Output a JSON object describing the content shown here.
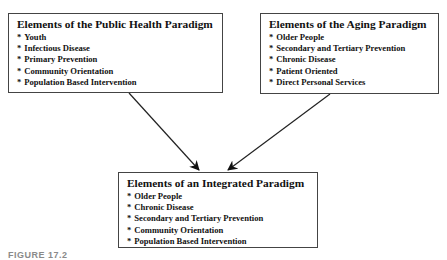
{
  "diagram": {
    "public_health": {
      "title": "Elements of the Public Health Paradigm",
      "items": [
        "Youth",
        "Infectious Disease",
        "Primary Prevention",
        "Community Orientation",
        "Population Based Intervention"
      ]
    },
    "aging": {
      "title": "Elements of the Aging Paradigm",
      "items": [
        "Older People",
        "Secondary and Tertiary Prevention",
        "Chronic Disease",
        "Patient Oriented",
        "Direct Personal Services"
      ]
    },
    "integrated": {
      "title": "Elements of an Integrated Paradigm",
      "items": [
        "Older People",
        "Chronic Disease",
        "Secondary and Tertiary Prevention",
        "Community Orientation",
        "Population Based Intervention"
      ]
    },
    "bullet": "*",
    "edges": [
      {
        "from": "public_health",
        "to": "integrated"
      },
      {
        "from": "aging",
        "to": "integrated"
      }
    ],
    "caption": "FIGURE 17.2"
  }
}
